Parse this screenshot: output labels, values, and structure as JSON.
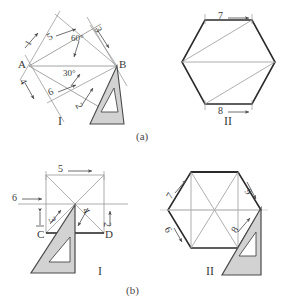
{
  "figure": {
    "caption_a": "(a)",
    "caption_b": "(b)"
  },
  "colors": {
    "line_dark": "#2b2b2b",
    "line_light": "#9a9a9a",
    "square_fill": "#d2d2d2",
    "square_stroke": "#4a4a4a",
    "text": "#3a3a3a",
    "background": "#ffffff"
  },
  "panel_a1": {
    "roman": "I",
    "point_a": "A",
    "point_b": "B",
    "angle_60": "60°",
    "angle_30": "30°",
    "steps": [
      "1",
      "5",
      "3",
      "4",
      "6",
      "2"
    ],
    "step_1": "1",
    "step_2": "2",
    "step_3": "3",
    "step_4": "4",
    "step_5": "5",
    "step_6": "6"
  },
  "panel_a2": {
    "roman": "II",
    "step_7": "7",
    "step_8": "8"
  },
  "panel_b1": {
    "roman": "I",
    "point_c": "C",
    "point_d": "D",
    "step_2": "2",
    "step_3": "3",
    "step_4": "4",
    "step_5": "5",
    "step_6": "6"
  },
  "panel_b2": {
    "roman": "II",
    "step_6": "6",
    "step_7": "7",
    "step_8": "8",
    "step_9": "9"
  }
}
